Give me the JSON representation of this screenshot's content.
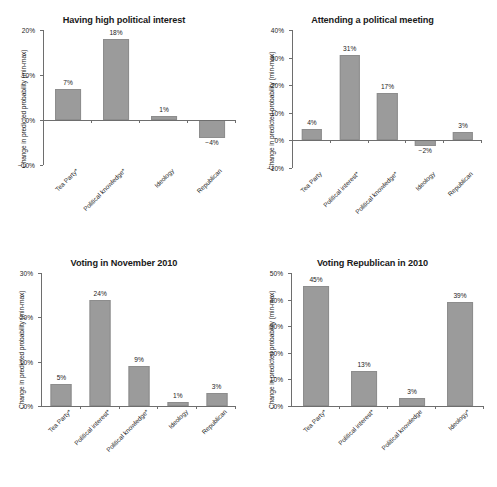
{
  "figure": {
    "bar_color": "#9b9b9b",
    "axis_color": "#6e6e6e",
    "text_color": "#1c1c1c",
    "ylabel": "Change in predicted probability (min-max)"
  },
  "chart_data": [
    {
      "type": "bar",
      "id": "having-high-political-interest",
      "title": "Having high political interest",
      "xlabel": "",
      "ylabel": "Change in predicted probability (min-max)",
      "ylim": [
        -10,
        20
      ],
      "yticks": [
        -10,
        0,
        10,
        20
      ],
      "yticklabels": [
        "−10%",
        "0%",
        "10%",
        "20%"
      ],
      "grid": false,
      "legend": false,
      "categories": [
        "Tea Party*",
        "Political knowledge*",
        "Ideology",
        "Republican"
      ],
      "values": [
        7,
        18,
        1,
        -4
      ],
      "datalabels": [
        "7%",
        "18%",
        "1%",
        "−4%"
      ]
    },
    {
      "type": "bar",
      "id": "attending-a-political-meeting",
      "title": "Attending a political meeting",
      "xlabel": "",
      "ylabel": "Change in predicted probability (min-max)",
      "ylim": [
        -10,
        40
      ],
      "yticks": [
        -10,
        0,
        10,
        20,
        30,
        40
      ],
      "yticklabels": [
        "−10%",
        "0%",
        "10%",
        "20%",
        "30%",
        "40%"
      ],
      "grid": false,
      "legend": false,
      "categories": [
        "Tea Party",
        "Political interest*",
        "Political knowledge*",
        "Ideology",
        "Republican"
      ],
      "values": [
        4,
        31,
        17,
        -2,
        3
      ],
      "datalabels": [
        "4%",
        "31%",
        "17%",
        "−2%",
        "3%"
      ]
    },
    {
      "type": "bar",
      "id": "voting-in-november-2010",
      "title": "Voting in November 2010",
      "xlabel": "",
      "ylabel": "Change in predicted probability (min-max)",
      "ylim": [
        0,
        30
      ],
      "yticks": [
        0,
        10,
        20,
        30
      ],
      "yticklabels": [
        "0%",
        "10%",
        "20%",
        "30%"
      ],
      "grid": false,
      "legend": false,
      "categories": [
        "Tea Party*",
        "Political interest*",
        "Political knowledge*",
        "Ideology",
        "Republican"
      ],
      "values": [
        5,
        24,
        9,
        1,
        3
      ],
      "datalabels": [
        "5%",
        "24%",
        "9%",
        "1%",
        "3%"
      ]
    },
    {
      "type": "bar",
      "id": "voting-republican-in-2010",
      "title": "Voting Republican in 2010",
      "xlabel": "",
      "ylabel": "Change in predicted probability (min-max)",
      "ylim": [
        0,
        50
      ],
      "yticks": [
        0,
        10,
        20,
        30,
        40,
        50
      ],
      "yticklabels": [
        "0%",
        "10%",
        "20%",
        "30%",
        "40%",
        "50%"
      ],
      "grid": false,
      "legend": false,
      "categories": [
        "Tea Party*",
        "Political interest*",
        "Political knowledge",
        "Ideology*"
      ],
      "values": [
        45,
        13,
        3,
        39
      ],
      "datalabels": [
        "45%",
        "13%",
        "3%",
        "39%"
      ]
    }
  ]
}
